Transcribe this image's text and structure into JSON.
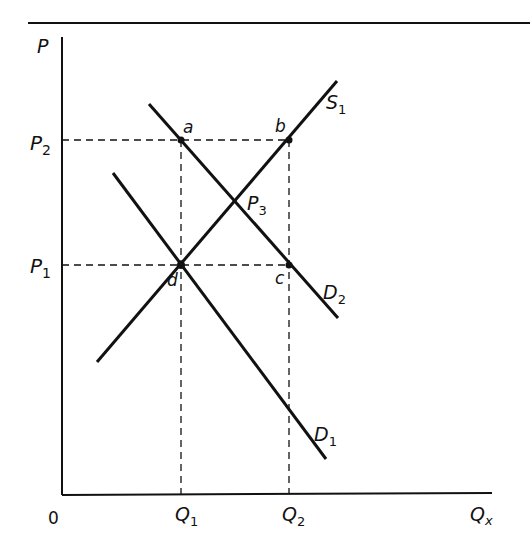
{
  "diagram": {
    "type": "supply-demand",
    "axes": {
      "y_label": "P",
      "x_label_main": "Q",
      "x_label_sub": "x",
      "origin_label": "0"
    },
    "price_ticks": [
      {
        "main": "P",
        "sub": "2"
      },
      {
        "main": "P",
        "sub": "1"
      }
    ],
    "quantity_ticks": [
      {
        "main": "Q",
        "sub": "1"
      },
      {
        "main": "Q",
        "sub": "2"
      }
    ],
    "curves": {
      "supply": {
        "main": "S",
        "sub": "1"
      },
      "demand_1": {
        "main": "D",
        "sub": "1"
      },
      "demand_2": {
        "main": "D",
        "sub": "2"
      }
    },
    "points": {
      "a": "a",
      "b": "b",
      "c": "c",
      "d": "d",
      "p3_main": "P",
      "p3_sub": "3"
    },
    "colors": {
      "line": "#111111",
      "background": "#ffffff"
    }
  }
}
